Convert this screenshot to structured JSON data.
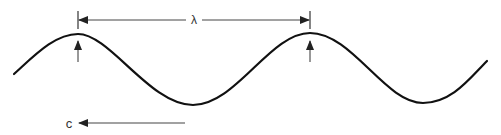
{
  "diagram": {
    "wave": {
      "color": "#111111",
      "path": "M 14 74 C 35 55, 55 34, 78 34 C 110 34, 150 105, 193 105 C 236 105, 270 33, 310 33 C 352 33, 385 103, 423 103 C 452 103, 470 78, 487 61"
    },
    "wavelength": {
      "label": "λ",
      "from_x": 78,
      "to_x": 310,
      "y": 20
    },
    "crest_markers": [
      {
        "x": 78,
        "y_top": 40,
        "y_bottom": 62
      },
      {
        "x": 310,
        "y_top": 40,
        "y_bottom": 62
      }
    ],
    "velocity": {
      "label": "c",
      "direction": "left",
      "from_x": 185,
      "to_x": 80,
      "y": 123
    },
    "line_color": "#333333"
  }
}
